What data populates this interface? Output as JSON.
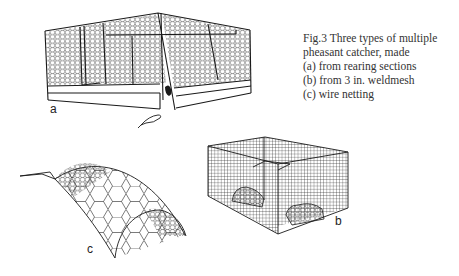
{
  "caption": {
    "title": "Fig.3 Three types of multiple",
    "line2": "pheasant catcher, made",
    "items": [
      "(a) from rearing sections",
      "(b) from 3 in. weldmesh",
      "(c) wire netting"
    ]
  },
  "labels": {
    "a": "a",
    "b": "b",
    "c": "c"
  },
  "colors": {
    "ink": "#1a1a1a",
    "caption": "#333333",
    "background": "#ffffff"
  }
}
